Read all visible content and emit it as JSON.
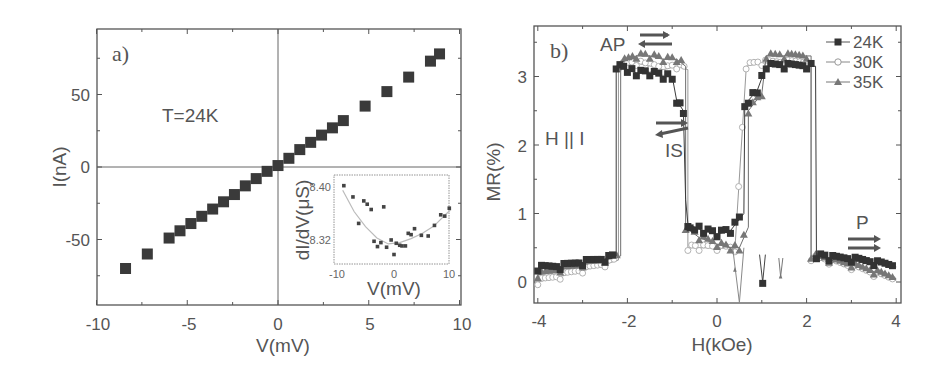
{
  "chart_data": [
    {
      "panel": "a)",
      "type": "scatter",
      "xlabel": "V(mV)",
      "ylabel": "I(nA)",
      "xlim": [
        -10,
        10
      ],
      "ylim": [
        -95,
        95
      ],
      "xticks": [
        "-10",
        "-5",
        "0",
        "5",
        "10"
      ],
      "yticks": [
        "-50",
        "0",
        "50"
      ],
      "annotation": "T=24K",
      "marker": "filled-square",
      "series": [
        {
          "name": "I-V",
          "x": [
            -8.4,
            -7.2,
            -6.0,
            -5.4,
            -4.8,
            -4.2,
            -3.6,
            -3.0,
            -2.4,
            -1.8,
            -1.2,
            -0.6,
            0.0,
            0.6,
            1.2,
            1.8,
            2.4,
            3.0,
            3.6,
            4.8,
            6.0,
            7.2,
            8.4,
            8.9
          ],
          "y": [
            -70,
            -60,
            -49,
            -44,
            -39,
            -34,
            -29,
            -24,
            -19,
            -13,
            -8,
            -3,
            1,
            6,
            12,
            17,
            22,
            27,
            32,
            42,
            52,
            62,
            73,
            78
          ]
        }
      ],
      "inset": {
        "type": "scatter",
        "xlabel": "V(mV)",
        "ylabel": "dI/dV(μS)",
        "xlim": [
          -10,
          10
        ],
        "xticks": [
          "-10",
          "0",
          "10"
        ],
        "yticks": [
          "8.40",
          "8.32"
        ],
        "points": {
          "x": [
            -8.8,
            -7.2,
            -6.2,
            -5.3,
            -4.7,
            -4.0,
            -3.5,
            -2.9,
            -2.3,
            -1.8,
            -1.3,
            -0.5,
            0.0,
            0.4,
            1.0,
            1.4,
            2.0,
            2.5,
            3.0,
            3.6,
            4.8,
            6.0,
            7.1,
            8.2,
            8.9,
            9.7
          ],
          "y": [
            8.402,
            8.385,
            8.345,
            8.379,
            8.374,
            8.366,
            8.318,
            8.31,
            8.316,
            8.37,
            8.309,
            8.32,
            8.298,
            8.315,
            8.312,
            8.311,
            8.311,
            8.33,
            8.328,
            8.337,
            8.327,
            8.326,
            8.342,
            8.358,
            8.356,
            8.368
          ]
        },
        "fit_curve": {
          "x": [
            -9,
            -7,
            -5,
            -3,
            -1,
            1,
            3,
            5,
            7,
            9,
            10
          ],
          "y": [
            8.395,
            8.363,
            8.34,
            8.323,
            8.314,
            8.316,
            8.322,
            8.33,
            8.341,
            8.358,
            8.366
          ]
        }
      }
    },
    {
      "panel": "b)",
      "type": "line",
      "xlabel": "H(kOe)",
      "ylabel": "MR(%)",
      "xlim": [
        -4,
        4
      ],
      "ylim": [
        -0.3,
        3.7
      ],
      "xticks": [
        "-4",
        "-2",
        "0",
        "2",
        "4"
      ],
      "yticks": [
        "0",
        "1",
        "2",
        "3"
      ],
      "legend": {
        "position": "upper-right",
        "entries": [
          "24K",
          "30K",
          "35K"
        ]
      },
      "annotations": [
        "AP",
        "IS",
        "P",
        "H || I"
      ],
      "series": [
        {
          "name": "24K",
          "marker": "filled-square",
          "x": [
            -4.0,
            -3.5,
            -3.0,
            -2.5,
            -2.25,
            -2.25,
            -2.0,
            -1.8,
            -1.5,
            -1.2,
            -1.0,
            -0.9,
            -0.75,
            -0.7,
            -0.65,
            -0.6,
            -0.5,
            -0.3,
            0.0,
            0.3,
            0.6,
            0.62,
            0.7,
            0.9,
            1.1,
            1.5,
            2.0,
            2.2,
            2.22,
            2.5,
            3.0,
            3.5,
            4.0
          ],
          "y": [
            0.2,
            0.22,
            0.28,
            0.33,
            0.38,
            3.15,
            3.1,
            3.05,
            3.05,
            3.0,
            3.0,
            2.65,
            2.5,
            1.2,
            0.85,
            0.83,
            0.8,
            0.75,
            0.7,
            0.75,
            1.0,
            2.6,
            2.65,
            2.8,
            3.15,
            3.15,
            3.15,
            3.15,
            0.38,
            0.35,
            0.33,
            0.28,
            0.22
          ]
        },
        {
          "name": "30K",
          "marker": "open-circle",
          "x": [
            -4.0,
            -3.5,
            -3.0,
            -2.5,
            -2.2,
            -2.2,
            -1.8,
            -1.5,
            -1.2,
            -0.9,
            -0.65,
            -0.65,
            -0.4,
            0.0,
            0.4,
            0.65,
            0.65,
            1.0,
            1.5,
            2.1,
            2.1,
            2.5,
            3.0,
            3.5,
            4.0
          ],
          "y": [
            0.0,
            0.08,
            0.17,
            0.26,
            0.32,
            3.15,
            3.2,
            3.15,
            3.1,
            3.15,
            3.1,
            0.5,
            0.5,
            0.5,
            0.48,
            3.1,
            3.15,
            3.2,
            3.2,
            3.2,
            0.35,
            0.3,
            0.22,
            0.12,
            0.02
          ]
        },
        {
          "name": "35K",
          "marker": "filled-triangle",
          "x": [
            -4.0,
            -3.5,
            -3.0,
            -2.5,
            -2.15,
            -2.15,
            -1.8,
            -1.5,
            -1.2,
            -0.9,
            -0.7,
            -0.7,
            -0.4,
            0.0,
            0.3,
            0.5,
            0.7,
            0.7,
            1.0,
            1.1,
            1.5,
            2.0,
            2.1,
            2.1,
            2.5,
            3.0,
            3.5,
            4.0
          ],
          "y": [
            0.1,
            0.18,
            0.25,
            0.32,
            0.38,
            3.2,
            3.3,
            3.3,
            3.25,
            3.25,
            3.15,
            0.8,
            0.65,
            0.55,
            0.5,
            0.5,
            0.8,
            2.5,
            2.75,
            3.3,
            3.3,
            3.3,
            3.3,
            0.38,
            0.32,
            0.25,
            0.15,
            0.05
          ]
        }
      ]
    }
  ],
  "panels": {
    "a": {
      "label": "a)",
      "annotation": "T=24K",
      "xlabel": "V(mV)",
      "ylabel": "I(nA)",
      "xticks": [
        "-10",
        "-5",
        "0",
        "5",
        "10"
      ],
      "yticks": [
        "50",
        "0",
        "-50"
      ],
      "inset": {
        "xlabel": "V(mV)",
        "ylabel": "dI/dV(μS)",
        "xticks": [
          "-10",
          "0",
          "10"
        ],
        "yticks": [
          "8.40",
          "8.32"
        ]
      }
    },
    "b": {
      "label": "b)",
      "xlabel": "H(kOe)",
      "ylabel": "MR(%)",
      "xticks": [
        "-4",
        "-2",
        "0",
        "2",
        "4"
      ],
      "yticks": [
        "3",
        "2",
        "1",
        "0"
      ],
      "ap": "AP",
      "is": "IS",
      "p": "P",
      "h_parallel_i": "H || I",
      "legend": [
        "24K",
        "30K",
        "35K"
      ]
    }
  }
}
